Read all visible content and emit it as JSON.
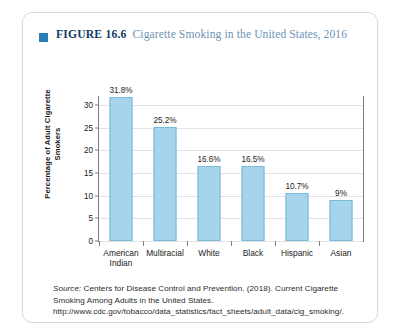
{
  "figure": {
    "marker_icon": "blue-square-icon",
    "label": "FIGURE 16.6",
    "caption": "Cigarette Smoking in the United States, 2016"
  },
  "chart_data": {
    "type": "bar",
    "title": "Cigarette Smoking in the United States, 2016",
    "xlabel": "",
    "ylabel": "Percentage of Adult Cigarette Smokers",
    "ylabel_line1": "Percentage of Adult Cigarette",
    "ylabel_line2": "Smokers",
    "ylim": [
      0,
      32
    ],
    "yticks": [
      0,
      5,
      10,
      15,
      20,
      25,
      30
    ],
    "ytick_labels": [
      "0",
      "5",
      "10",
      "15",
      "20",
      "25",
      "30"
    ],
    "grid": true,
    "legend": "none",
    "categories": [
      "American Indian",
      "Multiracial",
      "White",
      "Black",
      "Hispanic",
      "Asian"
    ],
    "values": [
      31.8,
      25.2,
      16.6,
      16.5,
      10.7,
      9.0
    ],
    "data_labels": [
      "31.8%",
      "25.2%",
      "16.6%",
      "16.5%",
      "10.7%",
      "9%"
    ],
    "bar_color": "#a5d4ec",
    "bar_border_color": "#7cb8d8"
  },
  "source": {
    "prefix": "Source:",
    "text": " Centers for Disease Control and Prevention. (2018). Current Cigarette Smoking Among Adults in the United States. http://www.cdc.gov/tobacco/data_statistics/fact_sheets/adult_data/cig_smoking/."
  }
}
